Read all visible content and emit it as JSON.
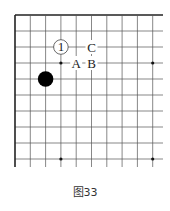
{
  "diagram": {
    "type": "go-board-corner",
    "caption": "图33",
    "grid": {
      "columns": 10,
      "rows": 10,
      "origin_x": 15,
      "origin_y": 15,
      "spacing_x": 15.3,
      "spacing_y": 16,
      "line_color": "#555555",
      "edge_color": "#222222"
    },
    "star_points": [
      {
        "col": 3,
        "row": 3
      },
      {
        "col": 9,
        "row": 3
      },
      {
        "col": 3,
        "row": 9
      },
      {
        "col": 9,
        "row": 9
      }
    ],
    "stones": [
      {
        "color": "black",
        "col": 2,
        "row": 4,
        "label": ""
      },
      {
        "color": "white",
        "col": 3,
        "row": 2,
        "label": "1"
      }
    ],
    "markers": [
      {
        "text": "C",
        "col": 5,
        "row": 2
      },
      {
        "text": "A",
        "col": 4,
        "row": 3
      },
      {
        "text": "B",
        "col": 5,
        "row": 3
      }
    ]
  }
}
